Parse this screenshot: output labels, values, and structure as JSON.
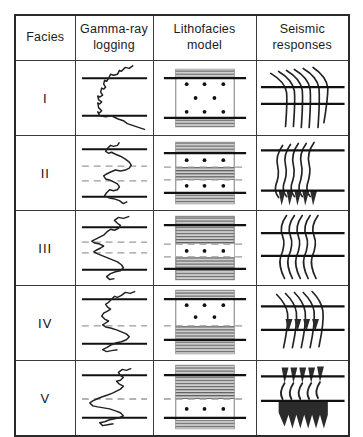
{
  "figure": {
    "colors": {
      "line": "#111111",
      "border": "#3a3a3a",
      "shale_fill": "#9a9a9a",
      "sand_fill": "#ffffff",
      "dash_marker": "#9a9a9a",
      "background": "#ffffff"
    }
  },
  "header": {
    "columns": [
      {
        "id": "facies",
        "label": "Facies",
        "lines": [
          "Facies"
        ]
      },
      {
        "id": "gamma_ray",
        "label": "Gamma-ray logging",
        "lines": [
          "Gamma-ray",
          "logging"
        ]
      },
      {
        "id": "lithofacies",
        "label": "Lithofacies model",
        "lines": [
          "Lithofacies",
          "model"
        ]
      },
      {
        "id": "seismic",
        "label": "Seismic responses",
        "lines": [
          "Seismic",
          "responses"
        ]
      }
    ]
  },
  "rows": [
    {
      "facies": "I",
      "gamma_ray": {
        "shape": "blocky-cylindrical",
        "markers": [
          "top-solid",
          "bottom-solid"
        ],
        "dashed_markers": 0
      },
      "lithofacies": {
        "description": "Thick sand body with shale caps",
        "layers": [
          {
            "type": "shale",
            "thickness": 8
          },
          {
            "type": "sand",
            "thickness": 48,
            "dots": 8
          },
          {
            "type": "shale",
            "thickness": 8
          }
        ],
        "boundaries": [
          "top-solid",
          "bottom-solid"
        ]
      },
      "seismic": {
        "traces": 6,
        "fill": "none",
        "style": "oblique-tangential",
        "boundaries": [
          "top-solid",
          "bottom-solid"
        ]
      }
    },
    {
      "facies": "II",
      "gamma_ray": {
        "shape": "serrated-double-bell",
        "markers": [
          "top-solid",
          "bottom-solid"
        ],
        "dashed_markers": 2
      },
      "lithofacies": {
        "description": "Two sand layers separated by shale interbed",
        "layers": [
          {
            "type": "shale",
            "thickness": 10
          },
          {
            "type": "sand",
            "thickness": 16,
            "dots": 3
          },
          {
            "type": "shale",
            "thickness": 14
          },
          {
            "type": "sand",
            "thickness": 16,
            "dots": 3
          },
          {
            "type": "shale",
            "thickness": 10
          }
        ],
        "boundaries": [
          "top-solid",
          "bottom-solid"
        ]
      },
      "seismic": {
        "traces": 5,
        "fill": "lower-peaks",
        "style": "sigmoid-wavy",
        "boundaries": [
          "top-solid",
          "bottom-solid"
        ]
      }
    },
    {
      "facies": "III",
      "gamma_ray": {
        "shape": "serrated-high-shale",
        "markers": [
          "top-solid",
          "bottom-solid"
        ],
        "dashed_markers": 2
      },
      "lithofacies": {
        "description": "Dominantly shale with thin sand interbed",
        "layers": [
          {
            "type": "shale",
            "thickness": 30
          },
          {
            "type": "sand",
            "thickness": 14,
            "dots": 3
          },
          {
            "type": "shale",
            "thickness": 20
          }
        ],
        "boundaries": [
          "top-solid",
          "bottom-solid"
        ]
      },
      "seismic": {
        "traces": 5,
        "fill": "none",
        "style": "wavy-continuous",
        "boundaries": [
          "top-solid",
          "bottom-solid"
        ]
      }
    },
    {
      "facies": "IV",
      "gamma_ray": {
        "shape": "funnel-coarsening-up",
        "markers": [
          "top-solid",
          "bottom-solid"
        ],
        "dashed_markers": 1
      },
      "lithofacies": {
        "description": "Sand above, shale below",
        "layers": [
          {
            "type": "shale",
            "thickness": 8
          },
          {
            "type": "sand",
            "thickness": 28,
            "dots": 5
          },
          {
            "type": "shale",
            "thickness": 28
          }
        ],
        "boundaries": [
          "top-solid",
          "bottom-solid"
        ]
      },
      "seismic": {
        "traces": 5,
        "fill": "middle-peaks",
        "style": "oblique-downlap",
        "boundaries": [
          "top-solid",
          "bottom-solid"
        ]
      }
    },
    {
      "facies": "V",
      "gamma_ray": {
        "shape": "bell-fining-up",
        "markers": [
          "top-solid",
          "bottom-solid"
        ],
        "dashed_markers": 1
      },
      "lithofacies": {
        "description": "Shale above, sand below",
        "layers": [
          {
            "type": "shale",
            "thickness": 34
          },
          {
            "type": "sand",
            "thickness": 20,
            "dots": 3
          },
          {
            "type": "shale",
            "thickness": 8
          }
        ],
        "boundaries": [
          "top-solid",
          "bottom-solid"
        ]
      },
      "seismic": {
        "traces": 5,
        "fill": "strong-peaks",
        "style": "high-amplitude-filled",
        "boundaries": [
          "top-solid",
          "bottom-solid"
        ]
      }
    }
  ]
}
